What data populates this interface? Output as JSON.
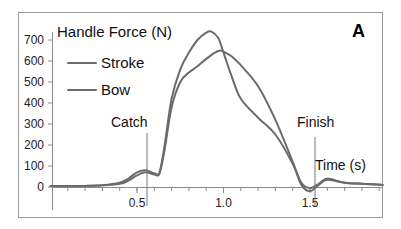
{
  "panel_label": "A",
  "chart_data": {
    "type": "line",
    "title": "Handle Force (N)",
    "xlabel": "Time (s)",
    "ylabel": "Handle Force (N)",
    "xlim": [
      0,
      1.92
    ],
    "ylim": [
      0,
      750
    ],
    "x_ticks": [
      0.5,
      1.0,
      1.5
    ],
    "x_tick_labels": [
      "0.5",
      "1.0",
      "1.5"
    ],
    "y_ticks": [
      0,
      100,
      200,
      300,
      400,
      500,
      600,
      700
    ],
    "y_tick_labels": [
      "0",
      "100",
      "200",
      "300",
      "400",
      "500",
      "600",
      "700"
    ],
    "grid": false,
    "legend_position": "upper-left",
    "legend": [
      "Stroke",
      "Bow"
    ],
    "annotations": [
      {
        "text": "Catch",
        "x": 0.57
      },
      {
        "text": "Finish",
        "x": 1.55
      },
      {
        "text": "Time (s)",
        "position": "near x-axis right"
      }
    ],
    "series": [
      {
        "name": "Stroke",
        "x": [
          0,
          0.1,
          0.2,
          0.3,
          0.4,
          0.45,
          0.5,
          0.55,
          0.6,
          0.63,
          0.66,
          0.7,
          0.75,
          0.8,
          0.85,
          0.9,
          0.93,
          0.97,
          1.0,
          1.05,
          1.1,
          1.2,
          1.3,
          1.4,
          1.45,
          1.5,
          1.55,
          1.6,
          1.7,
          1.8,
          1.92
        ],
        "y": [
          5,
          5,
          5,
          8,
          20,
          40,
          70,
          80,
          65,
          70,
          200,
          420,
          560,
          640,
          700,
          735,
          740,
          710,
          640,
          520,
          420,
          330,
          250,
          110,
          10,
          -20,
          10,
          35,
          20,
          15,
          10
        ]
      },
      {
        "name": "Bow",
        "x": [
          0,
          0.1,
          0.2,
          0.3,
          0.4,
          0.45,
          0.5,
          0.55,
          0.6,
          0.63,
          0.66,
          0.7,
          0.75,
          0.8,
          0.85,
          0.9,
          0.95,
          0.98,
          1.0,
          1.05,
          1.1,
          1.2,
          1.3,
          1.4,
          1.45,
          1.5,
          1.55,
          1.6,
          1.7,
          1.8,
          1.92
        ],
        "y": [
          5,
          5,
          5,
          8,
          15,
          30,
          55,
          70,
          60,
          65,
          180,
          380,
          500,
          545,
          575,
          610,
          640,
          650,
          645,
          620,
          580,
          480,
          320,
          120,
          20,
          -5,
          15,
          40,
          20,
          15,
          10
        ]
      }
    ]
  }
}
